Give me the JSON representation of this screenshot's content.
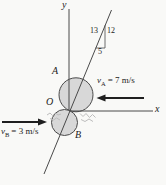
{
  "figure": {
    "axis_labels": {
      "x": "x",
      "y": "y"
    },
    "origin_label": "O",
    "disk_a_label": "A",
    "disk_b_label": "B",
    "slope_triangle": {
      "hypotenuse": "13",
      "rise": "12",
      "run": "5"
    },
    "velocity_a": {
      "symbol": "v",
      "subscript": "A",
      "rest": "= 7 m/s"
    },
    "velocity_b": {
      "symbol": "v",
      "subscript": "B",
      "rest": "= 3 m/s"
    },
    "colors": {
      "disk_fill": "#d8d8d8",
      "line": "#4a4a4a",
      "arrow": "#1f1f1f",
      "spark": "#bdbdbd",
      "background": "#f9f9f7"
    }
  }
}
